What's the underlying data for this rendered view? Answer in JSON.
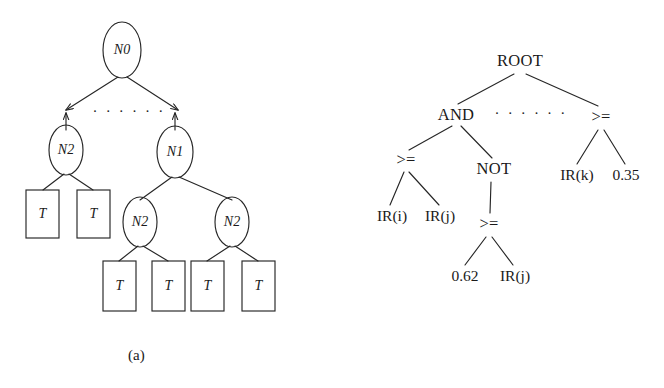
{
  "figure": {
    "background_color": "#ffffff",
    "stroke_color": "#262626",
    "text_color": "#1a1a1a"
  },
  "panel_a": {
    "caption": "(a)",
    "ellipsis": "· · · · · ·",
    "nodes": {
      "root": "N0",
      "left_branch": "N2",
      "right_branch": "N1",
      "right_child_left": "N2",
      "right_child_right": "N2"
    },
    "terminals": {
      "label": "T",
      "count": 6
    },
    "node_list": [
      {
        "id": "n0",
        "label": "N0",
        "shape": "ellipse",
        "cx": 122,
        "cy": 50,
        "rx": 19,
        "ry": 28
      },
      {
        "id": "n2a",
        "label": "N2",
        "shape": "ellipse",
        "cx": 66,
        "cy": 150,
        "rx": 17,
        "ry": 25
      },
      {
        "id": "n1",
        "label": "N1",
        "shape": "ellipse",
        "cx": 175,
        "cy": 152,
        "rx": 18,
        "ry": 26
      },
      {
        "id": "n2b",
        "label": "N2",
        "shape": "ellipse",
        "cx": 140,
        "cy": 222,
        "rx": 17,
        "ry": 25
      },
      {
        "id": "n2c",
        "label": "N2",
        "shape": "ellipse",
        "cx": 232,
        "cy": 222,
        "rx": 17,
        "ry": 25
      },
      {
        "id": "t1",
        "label": "T",
        "shape": "box",
        "x": 26,
        "y": 190,
        "w": 33,
        "h": 48
      },
      {
        "id": "t2",
        "label": "T",
        "shape": "box",
        "x": 77,
        "y": 190,
        "w": 33,
        "h": 48
      },
      {
        "id": "t3",
        "label": "T",
        "shape": "box",
        "x": 103,
        "y": 261,
        "w": 33,
        "h": 50
      },
      {
        "id": "t4",
        "label": "T",
        "shape": "box",
        "x": 152,
        "y": 261,
        "w": 33,
        "h": 50
      },
      {
        "id": "t5",
        "label": "T",
        "shape": "box",
        "x": 191,
        "y": 261,
        "w": 33,
        "h": 50
      },
      {
        "id": "t6",
        "label": "T",
        "shape": "box",
        "x": 242,
        "y": 261,
        "w": 33,
        "h": 50
      }
    ]
  },
  "panel_b": {
    "caption": "(b)",
    "ellipsis": "· · · · · ·",
    "nodes": {
      "root": "ROOT",
      "and": "AND",
      "ge_right_top": ">=",
      "ge_left": ">=",
      "not": "NOT",
      "ge_under_not": ">="
    },
    "leaves": {
      "ir_i": "IR(i)",
      "ir_j": "IR(j)",
      "const_062": "0.62",
      "ir_j2": "IR(j)",
      "ir_k": "IR(k)",
      "const_035": "0.35"
    },
    "node_list": [
      {
        "id": "root",
        "label": "ROOT",
        "x": 188,
        "y": 62,
        "type": "operator"
      },
      {
        "id": "and",
        "label": "AND",
        "x": 124,
        "y": 116,
        "type": "operator"
      },
      {
        "id": "ge_r",
        "label": ">=",
        "x": 269,
        "y": 118,
        "type": "operator"
      },
      {
        "id": "ge_l",
        "label": ">=",
        "x": 74,
        "y": 161,
        "type": "operator"
      },
      {
        "id": "not",
        "label": "NOT",
        "x": 162,
        "y": 170,
        "type": "operator"
      },
      {
        "id": "ge_n",
        "label": ">=",
        "x": 157,
        "y": 225,
        "type": "operator"
      },
      {
        "id": "ir_i",
        "label": "IR(i)",
        "x": 60,
        "y": 217,
        "type": "leaf"
      },
      {
        "id": "ir_j",
        "label": "IR(j)",
        "x": 108,
        "y": 217,
        "type": "leaf"
      },
      {
        "id": "c062",
        "label": "0.62",
        "x": 133,
        "y": 277,
        "type": "leaf"
      },
      {
        "id": "irj2",
        "label": "IR(j)",
        "x": 183,
        "y": 277,
        "type": "leaf"
      },
      {
        "id": "ir_k",
        "label": "IR(k)",
        "x": 245,
        "y": 176,
        "type": "leaf"
      },
      {
        "id": "c035",
        "label": "0.35",
        "x": 294,
        "y": 176,
        "type": "leaf"
      }
    ]
  }
}
